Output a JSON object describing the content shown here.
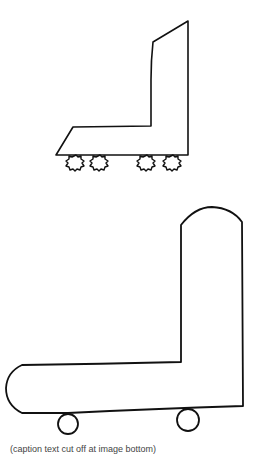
{
  "figure": {
    "top_drawing": {
      "label": "skate-with-four-fuzzy-wheels",
      "stroke_color": "#111111",
      "outline": [
        [
          188,
          21
        ],
        [
          153,
          42
        ],
        [
          151,
          126
        ],
        [
          73,
          127
        ],
        [
          56,
          155
        ],
        [
          188,
          155
        ]
      ],
      "wheels": [
        {
          "cx": 76,
          "cy": 162,
          "r": 7
        },
        {
          "cx": 100,
          "cy": 162,
          "r": 7
        },
        {
          "cx": 147,
          "cy": 162,
          "r": 7
        },
        {
          "cx": 173,
          "cy": 162,
          "r": 7
        }
      ]
    },
    "bottom_drawing": {
      "label": "rounded-skate-with-two-wheels",
      "stroke_color": "#111111",
      "wheels": [
        {
          "cx": 68,
          "cy": 424,
          "r": 10
        },
        {
          "cx": 188,
          "cy": 420,
          "r": 11
        }
      ]
    },
    "caption": "(caption text cut off at image bottom)"
  }
}
